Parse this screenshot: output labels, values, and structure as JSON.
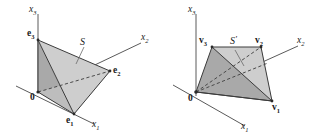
{
  "figure": {
    "kind": "two-panel-3d-geometry-diagram",
    "background_color": "#ffffff",
    "stroke_color": "#3c3c3c",
    "fill_light": "#cecece",
    "fill_mid": "#bdbdbd",
    "fill_dark": "#a9a9a9"
  },
  "left_panel": {
    "name": "standard-simplex-panel",
    "set_label": "S",
    "axes": [
      {
        "id": "x1",
        "label": "x",
        "subscript": "1"
      },
      {
        "id": "x2",
        "label": "x",
        "subscript": "2"
      },
      {
        "id": "x3",
        "label": "x",
        "subscript": "3"
      }
    ],
    "points": [
      {
        "id": "origin",
        "label": "0",
        "subscript": ""
      },
      {
        "id": "e1",
        "label": "e",
        "subscript": "1"
      },
      {
        "id": "e2",
        "label": "e",
        "subscript": "2"
      },
      {
        "id": "e3",
        "label": "e",
        "subscript": "3"
      }
    ]
  },
  "right_panel": {
    "name": "transformed-simplex-panel",
    "set_label": "S",
    "set_prime": "′",
    "axes": [
      {
        "id": "x1",
        "label": "x",
        "subscript": "1"
      },
      {
        "id": "x2",
        "label": "x",
        "subscript": "2"
      },
      {
        "id": "x3",
        "label": "x",
        "subscript": "3"
      }
    ],
    "points": [
      {
        "id": "origin",
        "label": "0",
        "subscript": ""
      },
      {
        "id": "v1",
        "label": "v",
        "subscript": "1"
      },
      {
        "id": "v2",
        "label": "v",
        "subscript": "2"
      },
      {
        "id": "v3",
        "label": "v",
        "subscript": "3"
      }
    ]
  }
}
